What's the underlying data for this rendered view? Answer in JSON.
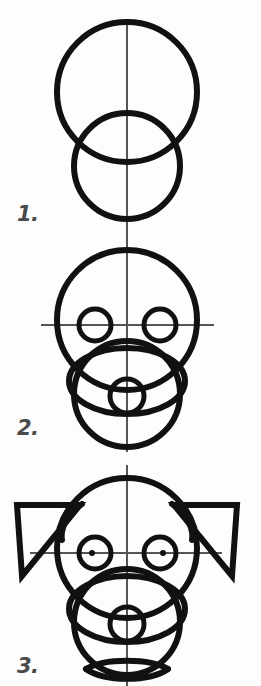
{
  "page": {
    "background_color": "#fdfdfd",
    "ink_color": "#111111",
    "guide_color": "#555555",
    "width": 261,
    "height": 686
  },
  "steps": [
    {
      "number": "1.",
      "name": "basic-shapes",
      "description": "Large cranium circle overlapping a smaller muzzle circle, with a vertical center guide line.",
      "shapes": [
        {
          "kind": "circle",
          "name": "cranium-circle",
          "cx": 127,
          "cy": 92,
          "r": 70,
          "stroke": 6
        },
        {
          "kind": "circle",
          "name": "muzzle-circle",
          "cx": 127,
          "cy": 166,
          "r": 53,
          "stroke": 6
        },
        {
          "kind": "line",
          "name": "vertical-center-guide",
          "x1": 127,
          "y1": 21,
          "x2": 127,
          "y2": 238,
          "stroke": 2
        }
      ]
    },
    {
      "number": "2.",
      "name": "eyes-and-nose",
      "description": "Same head shapes with a horizontal eye guide line, two eye circles, an oval muzzle and a small nose circle.",
      "shapes": [
        {
          "kind": "circle",
          "name": "cranium-circle",
          "cx": 127,
          "cy": 320,
          "r": 70,
          "stroke": 6
        },
        {
          "kind": "circle",
          "name": "muzzle-circle",
          "cx": 127,
          "cy": 394,
          "r": 53,
          "stroke": 6
        },
        {
          "kind": "line",
          "name": "vertical-center-guide",
          "x1": 127,
          "y1": 237,
          "x2": 127,
          "y2": 452,
          "stroke": 2
        },
        {
          "kind": "line",
          "name": "horizontal-eye-guide",
          "x1": 41,
          "y1": 325,
          "x2": 214,
          "y2": 325,
          "stroke": 2
        },
        {
          "kind": "circle",
          "name": "left-eye-circle",
          "cx": 95,
          "cy": 325,
          "r": 16,
          "stroke": 5
        },
        {
          "kind": "circle",
          "name": "right-eye-circle",
          "cx": 160,
          "cy": 325,
          "r": 16,
          "stroke": 5
        },
        {
          "kind": "ellipse",
          "name": "muzzle-oval",
          "cx": 127,
          "cy": 381,
          "rx": 58,
          "ry": 33,
          "stroke": 6
        },
        {
          "kind": "circle",
          "name": "nose-circle",
          "cx": 127,
          "cy": 396,
          "r": 17,
          "stroke": 5
        }
      ]
    },
    {
      "number": "3.",
      "name": "ears-and-mouth",
      "description": "Head with folded triangular ears added on both sides, pupils marked in the eyes and a lens shaped mouth below the muzzle.",
      "shapes": [
        {
          "kind": "circle",
          "name": "cranium-circle",
          "cx": 127,
          "cy": 548,
          "r": 70,
          "stroke": 6
        },
        {
          "kind": "circle",
          "name": "muzzle-circle",
          "cx": 127,
          "cy": 622,
          "r": 53,
          "stroke": 6
        },
        {
          "kind": "line",
          "name": "vertical-center-guide",
          "x1": 127,
          "y1": 465,
          "x2": 127,
          "y2": 686,
          "stroke": 2
        },
        {
          "kind": "line",
          "name": "horizontal-eye-guide",
          "x1": 30,
          "y1": 553,
          "x2": 222,
          "y2": 553,
          "stroke": 2
        },
        {
          "kind": "circle",
          "name": "left-eye-circle",
          "cx": 95,
          "cy": 553,
          "r": 16,
          "stroke": 5
        },
        {
          "kind": "circle",
          "name": "right-eye-circle",
          "cx": 160,
          "cy": 553,
          "r": 16,
          "stroke": 5
        },
        {
          "kind": "dot",
          "name": "left-pupil-dot",
          "cx": 92,
          "cy": 553,
          "r": 3
        },
        {
          "kind": "dot",
          "name": "right-pupil-dot",
          "cx": 163,
          "cy": 553,
          "r": 3
        },
        {
          "kind": "ellipse",
          "name": "muzzle-oval",
          "cx": 127,
          "cy": 609,
          "rx": 58,
          "ry": 33,
          "stroke": 6
        },
        {
          "kind": "circle",
          "name": "nose-circle",
          "cx": 127,
          "cy": 624,
          "r": 17,
          "stroke": 5
        },
        {
          "kind": "polygon",
          "name": "left-ear-triangle",
          "points": "17,505 80,505 22,576",
          "stroke": 6
        },
        {
          "kind": "polygon",
          "name": "right-ear-triangle",
          "points": "237,505 174,505 232,576",
          "stroke": 6
        },
        {
          "kind": "path",
          "name": "left-ear-fold",
          "d": "M 82,504 C 68,513 60,528 62,540",
          "stroke": 6
        },
        {
          "kind": "path",
          "name": "right-ear-fold",
          "d": "M 172,504 C 186,513 194,528 192,540",
          "stroke": 6
        },
        {
          "kind": "path",
          "name": "mouth-upper-arc",
          "d": "M 86,669 C 104,658 150,658 168,669",
          "stroke": 6
        },
        {
          "kind": "path",
          "name": "mouth-lower-arc",
          "d": "M 86,669 C 104,682 150,682 168,669",
          "stroke": 6
        }
      ]
    }
  ]
}
